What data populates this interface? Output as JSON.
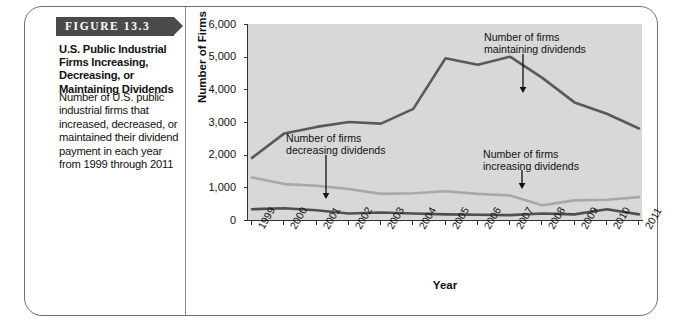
{
  "figure": {
    "banner_label": "FIGURE 13.3",
    "caption_title": "U.S. Public Industrial Firms Increasing, Decreasing, or Maintaining Dividends",
    "caption_body": "Number of U.S. public industrial firms that increased, decreased, or maintained their dividend payment in each year from 1999 through 2011"
  },
  "colors": {
    "plot_background": "#d8d8d8",
    "maintaining": "#5a5a5a",
    "decreasing": "#4f4f4f",
    "increasing": "#a8a8a8",
    "axis": "#333333",
    "banner": "#4a4a4a",
    "frame": "#6e6e6e"
  },
  "chart_data": {
    "type": "line",
    "title": "",
    "xlabel": "Year",
    "ylabel": "Number of Firms",
    "categories": [
      "1999",
      "2000",
      "2001",
      "2002",
      "2003",
      "2004",
      "2005",
      "2006",
      "2007",
      "2008",
      "2009",
      "2010",
      "2011"
    ],
    "x": [
      1999,
      2000,
      2001,
      2002,
      2003,
      2004,
      2005,
      2006,
      2007,
      2008,
      2009,
      2010,
      2011
    ],
    "ylim": [
      0,
      6000
    ],
    "yticks": [
      "0",
      "1,000",
      "2,000",
      "3,000",
      "4,000",
      "5,000",
      "6,000"
    ],
    "ytick_values": [
      0,
      1000,
      2000,
      3000,
      4000,
      5000,
      6000
    ],
    "grid": false,
    "legend": "annotations",
    "series": [
      {
        "name": "Number of firms maintaining dividends",
        "key": "maintaining",
        "color": "#5a5a5a",
        "values": [
          1900,
          2650,
          2850,
          3000,
          2950,
          3400,
          4950,
          4750,
          5000,
          4350,
          3600,
          3250,
          2800
        ]
      },
      {
        "name": "Number of firms increasing dividends",
        "key": "increasing",
        "color": "#a8a8a8",
        "values": [
          1300,
          1100,
          1050,
          950,
          800,
          820,
          880,
          800,
          750,
          450,
          600,
          620,
          700
        ]
      },
      {
        "name": "Number of firms decreasing dividends",
        "key": "decreasing",
        "color": "#4f4f4f",
        "values": [
          330,
          360,
          300,
          200,
          230,
          200,
          170,
          160,
          150,
          200,
          170,
          330,
          170
        ]
      }
    ],
    "annotations": [
      {
        "key": "maintaining",
        "text": "Number of firms\nmaintaining dividends",
        "points_to_year": 2009
      },
      {
        "key": "decreasing",
        "text": "Number of firms\ndecreasing dividends",
        "points_to_year": 2002
      },
      {
        "key": "increasing",
        "text": "Number of firms\nincreasing dividends",
        "points_to_year": 2009
      }
    ]
  }
}
